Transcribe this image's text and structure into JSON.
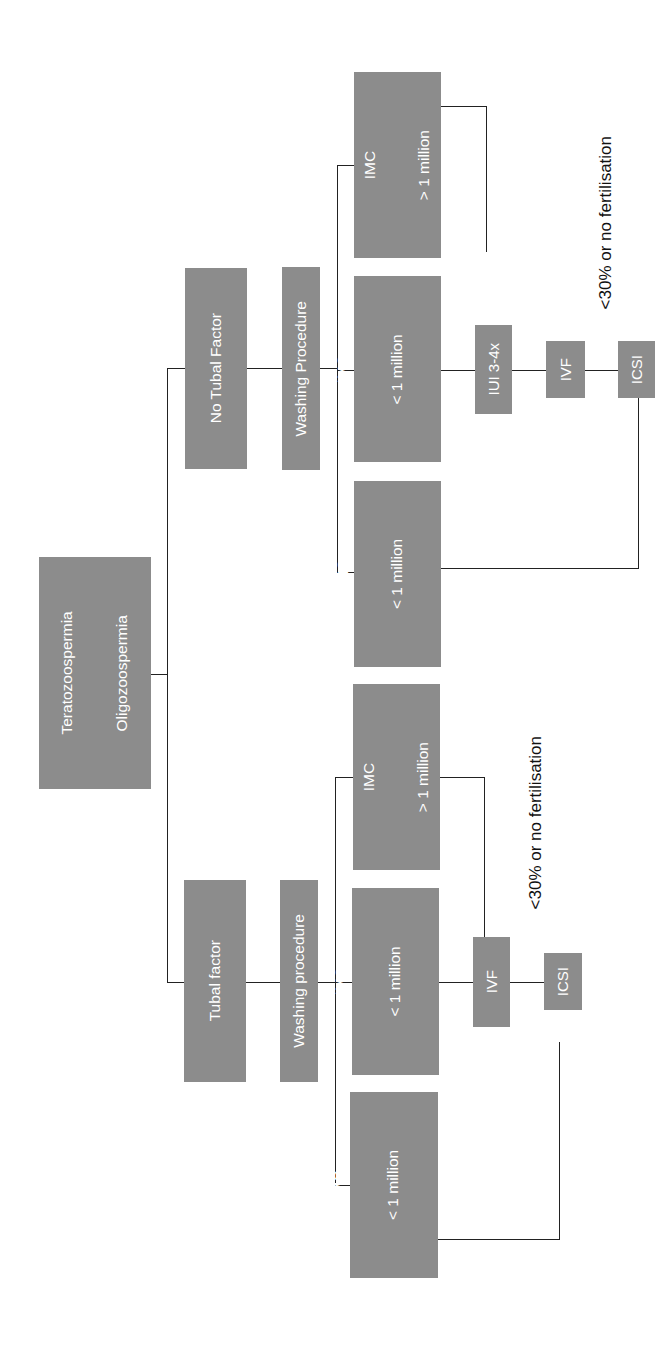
{
  "diagram": {
    "orientation": "rotated-90-ccw",
    "box_color": "#8c8c8c",
    "text_color": "#ffffff",
    "line_color": "#222222",
    "root": {
      "lines": [
        "Male Factor Subfertility",
        "Teratozoospermia",
        "Oligozoospermia",
        "Astenozoospermia"
      ]
    },
    "branches": {
      "no_tubal": {
        "label": "No Tubal Factor",
        "washing": "Washing Procedure",
        "imc_lt1_morph_lt4": [
          "IMC",
          "< 1 million",
          "Morphology < 4%"
        ],
        "imc_lt1_morph_ge4": [
          "IMC",
          "< 1 million",
          "Morphology ≥ 4%"
        ],
        "imc_gt1": [
          "IMC",
          "> 1 million"
        ],
        "iui": "IUI 3-4x",
        "ivf": "IVF",
        "icsi": "ICSI",
        "note": "<30% or no fertilisation"
      },
      "tubal": {
        "label": "Tubal factor",
        "washing": "Washing procedure",
        "imc_lt1_morph_lt4": [
          "IMC",
          "< 1 million",
          "Morphology < 4%"
        ],
        "imc_lt1_morph_ge4": [
          "IMC",
          "< 1 million",
          "Morphology ≥ 4%"
        ],
        "imc_gt1": [
          "IMC",
          "> 1 million"
        ],
        "ivf": "IVF",
        "icsi": "ICSI",
        "note": "<30% or no fertilisation"
      }
    }
  }
}
